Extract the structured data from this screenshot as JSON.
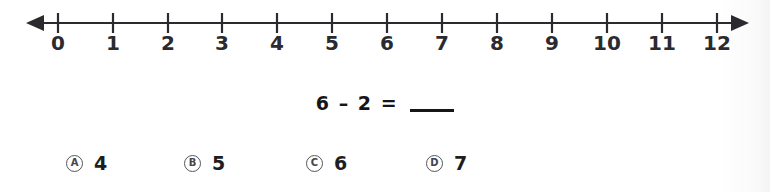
{
  "worksheet": {
    "number_line": {
      "name": "number-line",
      "ticks": [
        {
          "value": 0,
          "label": "0",
          "x": 58
        },
        {
          "value": 1,
          "label": "1",
          "x": 113
        },
        {
          "value": 2,
          "label": "2",
          "x": 168
        },
        {
          "value": 3,
          "label": "3",
          "x": 222
        },
        {
          "value": 4,
          "label": "4",
          "x": 277
        },
        {
          "value": 5,
          "label": "5",
          "x": 332
        },
        {
          "value": 6,
          "label": "6",
          "x": 387
        },
        {
          "value": 7,
          "label": "7",
          "x": 442
        },
        {
          "value": 8,
          "label": "8",
          "x": 497
        },
        {
          "value": 9,
          "label": "9",
          "x": 552
        },
        {
          "value": 10,
          "label": "10",
          "x": 607
        },
        {
          "value": 11,
          "label": "11",
          "x": 662
        },
        {
          "value": 12,
          "label": "12",
          "x": 717
        }
      ],
      "min": 0,
      "max": 12,
      "left_arrow": true,
      "right_arrow": true,
      "axis_color": "#2b2b2f"
    },
    "problem": {
      "first_operand": "6",
      "operator": "–",
      "second_operand": "2",
      "equals": "=",
      "answer_blank": ""
    },
    "choices": [
      {
        "letter": "A",
        "value": "4",
        "x": 66
      },
      {
        "letter": "B",
        "value": "5",
        "x": 184
      },
      {
        "letter": "C",
        "value": "6",
        "x": 306
      },
      {
        "letter": "D",
        "value": "7",
        "x": 426
      }
    ]
  }
}
